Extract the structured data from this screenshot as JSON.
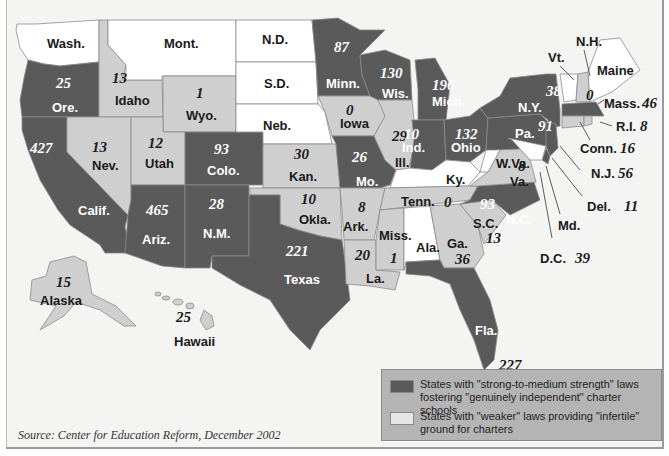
{
  "map": {
    "title": "Charter schools by state",
    "source": "Source: Center for Education Reform, December 2002",
    "colors": {
      "strong": "#5a5a5a",
      "weak": "#cfcfcf",
      "none": "#ffffff",
      "background": "#f4f4f2",
      "legend_bg": "#b4b4b4"
    },
    "legend": [
      {
        "category": "strong",
        "label": "States with \"strong-to-medium strength\" laws fostering \"genuinely independent\" charter schools"
      },
      {
        "category": "weak",
        "label": "States with \"weaker\" laws providing \"infertile\" ground for charters"
      }
    ],
    "states": {
      "wash": {
        "name": "Wash.",
        "value": null,
        "category": "none"
      },
      "ore": {
        "name": "Ore.",
        "value": "25",
        "category": "strong"
      },
      "calif": {
        "name": "Calif.",
        "value": "427",
        "category": "strong"
      },
      "idaho": {
        "name": "Idaho",
        "value": "13",
        "category": "weak"
      },
      "nev": {
        "name": "Nev.",
        "value": "13",
        "category": "weak"
      },
      "mont": {
        "name": "Mont.",
        "value": null,
        "category": "none"
      },
      "wyo": {
        "name": "Wyo.",
        "value": "1",
        "category": "weak"
      },
      "utah": {
        "name": "Utah",
        "value": "12",
        "category": "weak"
      },
      "colo": {
        "name": "Colo.",
        "value": "93",
        "category": "strong"
      },
      "ariz": {
        "name": "Ariz.",
        "value": "465",
        "category": "strong"
      },
      "nm": {
        "name": "N.M.",
        "value": "28",
        "category": "strong"
      },
      "nd": {
        "name": "N.D.",
        "value": null,
        "category": "none"
      },
      "sd": {
        "name": "S.D.",
        "value": null,
        "category": "none"
      },
      "neb": {
        "name": "Neb.",
        "value": null,
        "category": "none"
      },
      "kan": {
        "name": "Kan.",
        "value": "30",
        "category": "weak"
      },
      "okla": {
        "name": "Okla.",
        "value": "10",
        "category": "weak"
      },
      "texas": {
        "name": "Texas",
        "value": "221",
        "category": "strong"
      },
      "minn": {
        "name": "Minn.",
        "value": "87",
        "category": "strong"
      },
      "iowa": {
        "name": "Iowa",
        "value": "0",
        "category": "weak"
      },
      "mo": {
        "name": "Mo.",
        "value": "26",
        "category": "strong"
      },
      "ark": {
        "name": "Ark.",
        "value": "8",
        "category": "weak"
      },
      "la": {
        "name": "La.",
        "value": "20",
        "category": "weak"
      },
      "wis": {
        "name": "Wis.",
        "value": "130",
        "category": "strong"
      },
      "ill": {
        "name": "Ill.",
        "value": "29",
        "category": "weak"
      },
      "mich": {
        "name": "Mich.",
        "value": "196",
        "category": "strong"
      },
      "ind": {
        "name": "Ind.",
        "value": "10",
        "category": "strong"
      },
      "ohio": {
        "name": "Ohio",
        "value": "132",
        "category": "strong"
      },
      "ky": {
        "name": "Ky.",
        "value": null,
        "category": "none"
      },
      "tenn": {
        "name": "Tenn.",
        "value": "0",
        "category": "weak"
      },
      "miss": {
        "name": "Miss.",
        "value": "1",
        "category": "weak"
      },
      "ala": {
        "name": "Ala.",
        "value": null,
        "category": "none"
      },
      "ga": {
        "name": "Ga.",
        "value": "36",
        "category": "weak"
      },
      "fla": {
        "name": "Fla.",
        "value": "227",
        "category": "strong"
      },
      "sc": {
        "name": "S.C.",
        "value": "13",
        "category": "weak"
      },
      "nc": {
        "name": "N.C.",
        "value": "93",
        "category": "strong"
      },
      "va": {
        "name": "Va.",
        "value": "8",
        "category": "weak"
      },
      "wva": {
        "name": "W.Va.",
        "value": null,
        "category": "none"
      },
      "pa": {
        "name": "Pa.",
        "value": "91",
        "category": "strong"
      },
      "ny": {
        "name": "N.Y.",
        "value": "38",
        "category": "strong"
      },
      "vt": {
        "name": "Vt.",
        "value": null,
        "category": "none"
      },
      "nh": {
        "name": "N.H.",
        "value": "0",
        "category": "weak"
      },
      "maine": {
        "name": "Maine",
        "value": null,
        "category": "none"
      },
      "mass": {
        "name": "Mass.",
        "value": "46",
        "category": "strong"
      },
      "ri": {
        "name": "R.I.",
        "value": "8",
        "category": "weak"
      },
      "conn": {
        "name": "Conn.",
        "value": "16",
        "category": "weak"
      },
      "nj": {
        "name": "N.J.",
        "value": "56",
        "category": "strong"
      },
      "del": {
        "name": "Del.",
        "value": "11",
        "category": "strong"
      },
      "md": {
        "name": "Md.",
        "value": null,
        "category": "none"
      },
      "dc": {
        "name": "D.C.",
        "value": "39",
        "category": "strong"
      },
      "alaska": {
        "name": "Alaska",
        "value": "15",
        "category": "weak"
      },
      "hawaii": {
        "name": "Hawaii",
        "value": "25",
        "category": "weak"
      }
    }
  }
}
